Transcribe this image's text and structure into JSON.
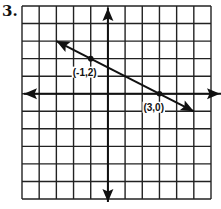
{
  "problem": {
    "number": "3."
  },
  "graph": {
    "grid": {
      "x_min": -5,
      "x_max": 6,
      "y_min": -6,
      "y_max": 5,
      "step": 1
    },
    "axes": {
      "x_axis_arrows": true,
      "y_axis_arrows": true
    },
    "line": {
      "slope": -0.5,
      "intercept": 1.5,
      "from": [
        -3,
        3
      ],
      "to": [
        5,
        -1
      ],
      "arrows": "both"
    },
    "points": [
      {
        "x": -1,
        "y": 2,
        "label": "(-1,2)"
      },
      {
        "x": 3,
        "y": 0,
        "label": "(3,0)"
      }
    ],
    "colors": {
      "ink": "#111111",
      "background": "#ffffff"
    }
  }
}
